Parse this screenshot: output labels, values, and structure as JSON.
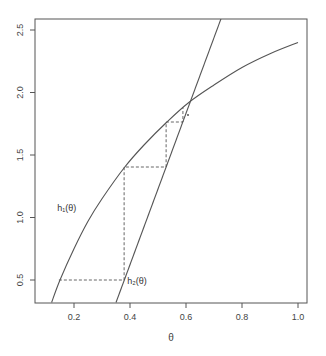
{
  "chart_data": {
    "type": "line",
    "title": "",
    "xlabel": "θ",
    "ylabel": "",
    "xlim": [
      0.07,
      1.04
    ],
    "ylim": [
      0.32,
      2.59
    ],
    "grid": false,
    "x_ticks": [
      0.2,
      0.4,
      0.6,
      0.8,
      1.0
    ],
    "x_tick_labels": [
      "0.2",
      "0.4",
      "0.6",
      "0.8",
      "1.0"
    ],
    "y_ticks": [
      0.5,
      1.0,
      1.5,
      2.0,
      2.5
    ],
    "y_tick_labels": [
      "0.5",
      "1.0",
      "1.5",
      "2.0",
      "2.5"
    ],
    "series": [
      {
        "name": "h₁(θ)",
        "style": "solid",
        "x": [
          0.12,
          0.15,
          0.2,
          0.25,
          0.3,
          0.38,
          0.45,
          0.53,
          0.61,
          0.7,
          0.8,
          0.9,
          1.0
        ],
        "values": [
          0.32,
          0.5,
          0.75,
          0.97,
          1.15,
          1.4,
          1.58,
          1.76,
          1.92,
          2.06,
          2.2,
          2.31,
          2.4
        ]
      },
      {
        "name": "h₂(θ)",
        "style": "solid",
        "x": [
          0.35,
          0.725
        ],
        "values": [
          0.32,
          2.59
        ]
      },
      {
        "name": "cobweb",
        "style": "dashed",
        "x": [
          0.146,
          0.379,
          0.379,
          0.529,
          0.529,
          0.589,
          0.589
        ],
        "values": [
          0.5,
          0.5,
          1.404,
          1.404,
          1.764,
          1.764,
          1.88
        ]
      }
    ],
    "annotations": [
      {
        "text": "h₁(θ)",
        "x": 0.14,
        "y": 1.05
      },
      {
        "text": "h₂(θ)",
        "x": 0.39,
        "y": 0.47
      }
    ],
    "legend": "none"
  },
  "labels": {
    "xlabel": "θ",
    "h1": "h₁(θ)",
    "h2": "h₂(θ)"
  }
}
